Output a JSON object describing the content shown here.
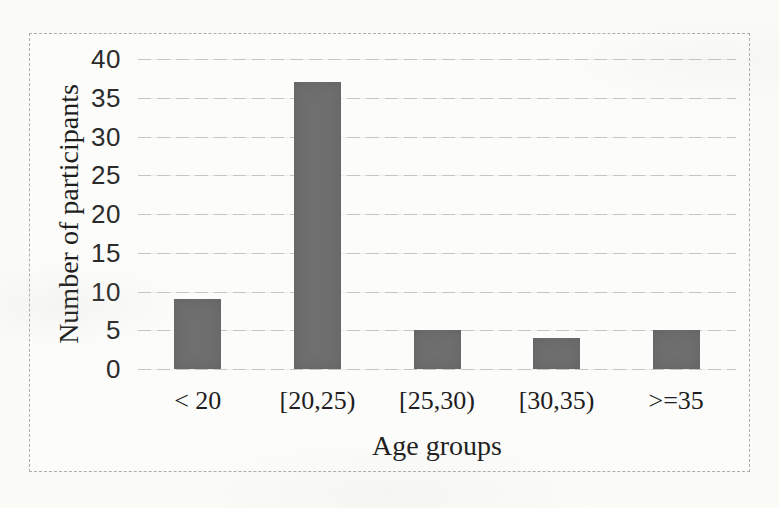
{
  "chart_data": {
    "type": "bar",
    "categories": [
      "< 20",
      "[20,25)",
      "[25,30)",
      "[30,35)",
      ">=35"
    ],
    "values": [
      9,
      37,
      5,
      4,
      5
    ],
    "title": "",
    "xlabel": "Age groups",
    "ylabel": "Number of participants",
    "ylim": [
      0,
      40
    ],
    "yticks": [
      0,
      5,
      10,
      15,
      20,
      25,
      30,
      35,
      40
    ],
    "grid": "horizontal-dashed",
    "legend": "none",
    "bar_width_px": 47
  },
  "colors": {
    "bar": "#6f6f6f",
    "gridline": "#c5c5c3",
    "chart_border": "#adadad",
    "text": "#1e1e1e",
    "background": "#fbfbf8"
  }
}
